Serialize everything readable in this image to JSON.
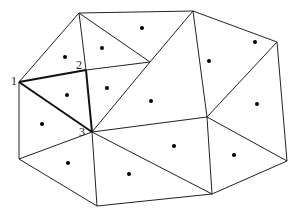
{
  "diagram": {
    "type": "triangulation-with-centroids",
    "vertices": {
      "A": [
        79,
        13
      ],
      "B": [
        193,
        11
      ],
      "C": [
        277,
        42
      ],
      "D": [
        287,
        161
      ],
      "E": [
        212,
        194
      ],
      "F": [
        97,
        206
      ],
      "G": [
        19,
        159
      ],
      "V1": [
        19,
        82
      ],
      "V2": [
        86,
        70
      ],
      "V3": [
        92,
        132
      ],
      "M": [
        150,
        62
      ],
      "N": [
        207,
        117
      ]
    },
    "edges": [
      [
        "A",
        "B"
      ],
      [
        "B",
        "C"
      ],
      [
        "C",
        "D"
      ],
      [
        "D",
        "E"
      ],
      [
        "E",
        "F"
      ],
      [
        "F",
        "G"
      ],
      [
        "G",
        "V1"
      ],
      [
        "V1",
        "A"
      ],
      [
        "A",
        "V2"
      ],
      [
        "A",
        "M"
      ],
      [
        "B",
        "M"
      ],
      [
        "B",
        "N"
      ],
      [
        "C",
        "N"
      ],
      [
        "D",
        "N"
      ],
      [
        "E",
        "N"
      ],
      [
        "V2",
        "M"
      ],
      [
        "V2",
        "V3"
      ],
      [
        "V3",
        "M"
      ],
      [
        "V3",
        "N"
      ],
      [
        "V3",
        "E"
      ],
      [
        "V3",
        "F"
      ],
      [
        "V3",
        "G"
      ],
      [
        "V1",
        "V2"
      ],
      [
        "V1",
        "V3"
      ]
    ],
    "highlighted_edges": [
      [
        "V1",
        "V2"
      ],
      [
        "V2",
        "V3"
      ],
      [
        "V1",
        "V3"
      ]
    ],
    "centroids": [
      [
        65,
        57
      ],
      [
        102,
        48
      ],
      [
        142,
        28
      ],
      [
        209,
        61
      ],
      [
        255,
        42
      ],
      [
        67,
        95
      ],
      [
        107,
        88
      ],
      [
        151,
        101
      ],
      [
        257,
        104
      ],
      [
        42,
        124
      ],
      [
        174,
        146
      ],
      [
        234,
        155
      ],
      [
        68,
        163
      ],
      [
        129,
        174
      ]
    ],
    "labels": [
      {
        "text": "1",
        "x": 11,
        "y": 85
      },
      {
        "text": "2",
        "x": 76,
        "y": 69
      },
      {
        "text": "3",
        "x": 79,
        "y": 136
      }
    ]
  }
}
